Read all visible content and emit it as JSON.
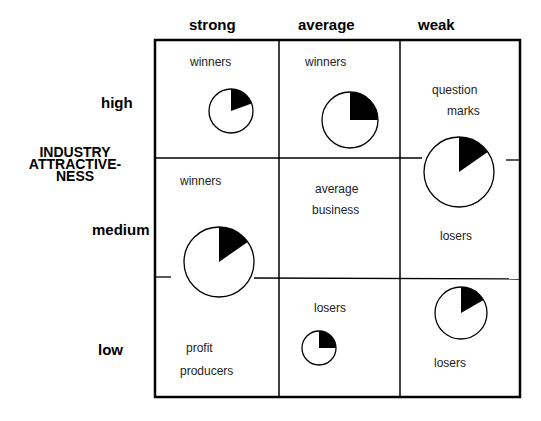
{
  "columns": [
    "strong",
    "average",
    "weak"
  ],
  "rows": [
    "high",
    "medium",
    "low"
  ],
  "y_axis_title": [
    "INDUSTRY",
    "ATTRACTIVE-",
    "NESS"
  ],
  "cell_labels": {
    "strong_high": "winners",
    "average_high": "winners",
    "weak_high_1": "question",
    "weak_high_2": "marks",
    "strong_medium": "winners",
    "average_medium_1": "average",
    "average_medium_2": "business",
    "weak_medium": "losers",
    "average_low": "losers",
    "strong_low_1": "profit",
    "strong_low_2": "producers",
    "weak_low": "losers"
  },
  "pies": [
    {
      "name": "strong-high",
      "cx": 231,
      "cy": 111,
      "r": 22,
      "slice_deg": 70
    },
    {
      "name": "average-high",
      "cx": 350,
      "cy": 120,
      "r": 28,
      "slice_deg": 90
    },
    {
      "name": "weak-high-medium",
      "cx": 459,
      "cy": 172,
      "r": 35,
      "slice_deg": 55
    },
    {
      "name": "strong-medium-low",
      "cx": 219,
      "cy": 262,
      "r": 35,
      "slice_deg": 55
    },
    {
      "name": "average-low",
      "cx": 319,
      "cy": 348,
      "r": 17,
      "slice_deg": 90
    },
    {
      "name": "weak-low",
      "cx": 461,
      "cy": 313,
      "r": 26,
      "slice_deg": 60
    }
  ]
}
